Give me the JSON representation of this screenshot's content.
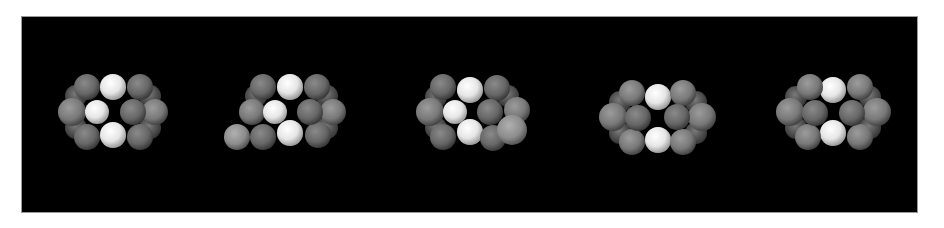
{
  "figure": {
    "background": "#ffffff",
    "panel": {
      "x": 22,
      "y": 17,
      "width": 895,
      "height": 195,
      "color": "#000000",
      "border": "#9a9a9a"
    },
    "colors": {
      "white_atom": "#f0f0f0",
      "dark_atom": "#6e6e6e",
      "mid_atom": "#858585",
      "light_atom": "#9a9a9a"
    },
    "clusters": [
      {
        "id": "cluster-1",
        "back": [
          [
            113,
            87,
            13
          ],
          [
            113,
            135,
            13
          ],
          [
            76,
            96,
            11
          ],
          [
            76,
            128,
            11
          ],
          [
            150,
            96,
            11
          ],
          [
            150,
            128,
            11
          ]
        ],
        "atoms": [
          [
            113,
            87,
            13,
            "white"
          ],
          [
            113,
            135,
            13,
            "white"
          ],
          [
            72,
            112,
            14,
            "mid"
          ],
          [
            155,
            112,
            13,
            "mid"
          ],
          [
            87,
            87,
            13,
            "dark"
          ],
          [
            87,
            137,
            13,
            "dark"
          ],
          [
            140,
            87,
            13,
            "dark"
          ],
          [
            140,
            137,
            13,
            "dark"
          ],
          [
            97,
            112,
            12,
            "white"
          ],
          [
            133,
            112,
            13,
            "dark"
          ]
        ]
      },
      {
        "id": "cluster-2",
        "back": [
          [
            290,
            87,
            13
          ],
          [
            290,
            133,
            13
          ],
          [
            256,
            96,
            11
          ],
          [
            327,
            96,
            11
          ],
          [
            327,
            128,
            11
          ]
        ],
        "atoms": [
          [
            290,
            87,
            13,
            "white"
          ],
          [
            290,
            133,
            13,
            "white"
          ],
          [
            252,
            112,
            13,
            "mid"
          ],
          [
            333,
            112,
            13,
            "mid"
          ],
          [
            263,
            87,
            13,
            "dark"
          ],
          [
            263,
            137,
            13,
            "dark"
          ],
          [
            317,
            87,
            13,
            "dark"
          ],
          [
            318,
            135,
            13,
            "dark"
          ],
          [
            237,
            137,
            13,
            "light"
          ],
          [
            275,
            112,
            12,
            "white"
          ],
          [
            310,
            112,
            13,
            "dark"
          ]
        ]
      },
      {
        "id": "cluster-3",
        "back": [
          [
            470,
            90,
            13
          ],
          [
            470,
            132,
            13
          ],
          [
            436,
            97,
            11
          ],
          [
            436,
            128,
            11
          ],
          [
            508,
            96,
            11
          ]
        ],
        "atoms": [
          [
            470,
            90,
            13,
            "white"
          ],
          [
            470,
            132,
            13,
            "white"
          ],
          [
            430,
            112,
            14,
            "mid"
          ],
          [
            517,
            110,
            13,
            "mid"
          ],
          [
            443,
            87,
            13,
            "dark"
          ],
          [
            443,
            137,
            13,
            "dark"
          ],
          [
            497,
            88,
            13,
            "dark"
          ],
          [
            493,
            138,
            13,
            "dark"
          ],
          [
            512,
            130,
            15,
            "light"
          ],
          [
            455,
            112,
            12,
            "white"
          ],
          [
            490,
            112,
            13,
            "dark"
          ]
        ]
      },
      {
        "id": "cluster-4",
        "back": [
          [
            658,
            97,
            13
          ],
          [
            658,
            140,
            13
          ],
          [
            620,
            102,
            11
          ],
          [
            620,
            133,
            11
          ],
          [
            696,
            102,
            11
          ],
          [
            696,
            133,
            11
          ]
        ],
        "atoms": [
          [
            658,
            97,
            13,
            "white"
          ],
          [
            658,
            140,
            13,
            "white"
          ],
          [
            613,
            117,
            14,
            "mid"
          ],
          [
            702,
            117,
            14,
            "mid"
          ],
          [
            632,
            93,
            13,
            "mid"
          ],
          [
            632,
            142,
            13,
            "mid"
          ],
          [
            683,
            93,
            13,
            "mid"
          ],
          [
            683,
            142,
            13,
            "mid"
          ],
          [
            638,
            118,
            13,
            "dark"
          ],
          [
            677,
            117,
            13,
            "dark"
          ]
        ]
      },
      {
        "id": "cluster-5",
        "back": [
          [
            833,
            90,
            13
          ],
          [
            833,
            133,
            13
          ],
          [
            796,
            97,
            11
          ],
          [
            796,
            128,
            11
          ],
          [
            870,
            97,
            11
          ],
          [
            870,
            128,
            11
          ]
        ],
        "atoms": [
          [
            833,
            90,
            13,
            "white"
          ],
          [
            833,
            133,
            13,
            "white"
          ],
          [
            790,
            112,
            14,
            "mid"
          ],
          [
            877,
            112,
            14,
            "mid"
          ],
          [
            810,
            87,
            13,
            "mid"
          ],
          [
            808,
            137,
            13,
            "mid"
          ],
          [
            860,
            87,
            13,
            "mid"
          ],
          [
            860,
            137,
            13,
            "mid"
          ],
          [
            815,
            113,
            13,
            "dark"
          ],
          [
            852,
            113,
            13,
            "dark"
          ]
        ]
      }
    ]
  }
}
